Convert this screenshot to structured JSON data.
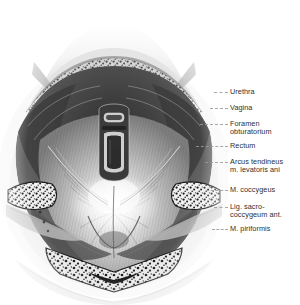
{
  "plate": {
    "title": "Female pelvic floor seen from above",
    "background_color": "#ffffff",
    "ink_color": "#2f2f2f",
    "leader_color": "#9a9a9a"
  },
  "labels": [
    {
      "id": "urethra",
      "lines": [
        "Urethra"
      ],
      "top": 88,
      "leader_y": 92,
      "leader_x": 214,
      "leader_w": 14
    },
    {
      "id": "vagina",
      "lines": [
        "Vagina"
      ],
      "top": 104,
      "leader_y": 108,
      "leader_x": 210,
      "leader_w": 18
    },
    {
      "id": "foramen",
      "lines": [
        "Foramen",
        "obturatorium"
      ],
      "top": 120,
      "leader_y": 124,
      "leader_x": 200,
      "leader_w": 28
    },
    {
      "id": "rectum",
      "lines": [
        "Rectum"
      ],
      "top": 142,
      "leader_y": 146,
      "leader_x": 196,
      "leader_w": 32
    },
    {
      "id": "arcus",
      "lines": [
        "Arcus tendineus",
        "m. levatoris ani"
      ],
      "top": 158,
      "leader_y": 162,
      "leader_x": 205,
      "leader_w": 23
    },
    {
      "id": "coccygeus",
      "lines": [
        "M. coccygeus"
      ],
      "top": 186,
      "leader_y": 190,
      "leader_x": 206,
      "leader_w": 22
    },
    {
      "id": "ligament",
      "lines": [
        "Lig. sacro-",
        "coccygeum ant."
      ],
      "top": 203,
      "leader_y": 207,
      "leader_x": 214,
      "leader_w": 14
    },
    {
      "id": "piriformis",
      "lines": [
        "M. piriformis"
      ],
      "top": 225,
      "leader_y": 229,
      "leader_x": 212,
      "leader_w": 16
    }
  ],
  "figure": {
    "structures": [
      "pubic symphysis",
      "urogenital hiatus",
      "urethral opening",
      "vaginal opening",
      "levator ani muscle",
      "arcus tendineus",
      "ischial bone cut surface left",
      "ischial bone cut surface right",
      "coccygeus muscle",
      "piriformis muscle",
      "sacrum cut surface",
      "sacral canal"
    ]
  }
}
